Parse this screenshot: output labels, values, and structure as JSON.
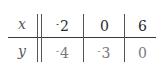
{
  "table": {
    "rows": [
      {
        "label": "x",
        "values": [
          {
            "sign": "-",
            "num": "2"
          },
          {
            "sign": "",
            "num": "0"
          },
          {
            "sign": "",
            "num": "6"
          }
        ]
      },
      {
        "label": "y",
        "values": [
          {
            "sign": "-",
            "num": "4"
          },
          {
            "sign": "-",
            "num": "3"
          },
          {
            "sign": "",
            "num": "0"
          }
        ]
      }
    ]
  }
}
